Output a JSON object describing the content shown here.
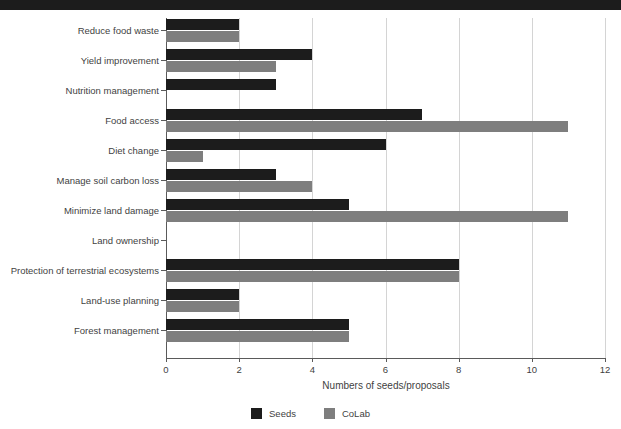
{
  "banner": {
    "present": true,
    "color": "#1c1c1c"
  },
  "chart_data": {
    "type": "bar",
    "orientation": "horizontal",
    "title": "",
    "xlabel": "Numbers of seeds/proposals",
    "ylabel": "",
    "xlim": [
      0,
      12
    ],
    "xticks": [
      0,
      2,
      4,
      6,
      8,
      10,
      12
    ],
    "grid": true,
    "grid_axis": "x",
    "legend_position": "bottom-center",
    "categories": [
      "Reduce food waste",
      "Yield improvement",
      "Nutrition management",
      "Food access",
      "Diet change",
      "Manage soil carbon loss",
      "Minimize land damage",
      "Land ownership",
      "Protection of terrestrial ecosystems",
      "Land-use planning",
      "Forest management"
    ],
    "series": [
      {
        "name": "Seeds",
        "color": "#1c1c1c",
        "values": [
          2,
          4,
          3,
          7,
          6,
          3,
          5,
          0,
          8,
          2,
          5
        ]
      },
      {
        "name": "CoLab",
        "color": "#7e7e7e",
        "values": [
          2,
          3,
          0,
          11,
          1,
          4,
          11,
          0,
          8,
          2,
          5
        ]
      }
    ]
  },
  "axis": {
    "tick_labels": [
      "0",
      "2",
      "4",
      "6",
      "8",
      "10",
      "12"
    ],
    "axis_color": "#5a5a5a",
    "grid_color": "#d4d4d4"
  }
}
